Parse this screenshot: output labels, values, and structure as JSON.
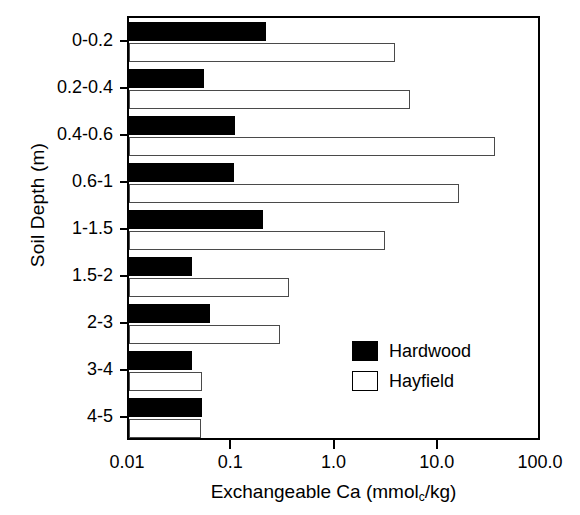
{
  "chart_data": {
    "type": "bar",
    "orientation": "horizontal",
    "title": "",
    "xlabel": "Exchangeable Ca (mmol_c/kg)",
    "xlabel_parts": {
      "main": "Exchangeable Ca (mmol",
      "sub": "c",
      "tail": "/kg)"
    },
    "ylabel": "Soil Depth (m)",
    "xscale": "log",
    "xlim": [
      0.01,
      100.0
    ],
    "xticks": [
      0.01,
      0.1,
      1.0,
      10.0,
      100.0
    ],
    "xticklabels": [
      "0.01",
      "0.1",
      "1.0",
      "10.0",
      "100.0"
    ],
    "grid": false,
    "legend_position": "center-right-inside",
    "categories": [
      "0-0.2",
      "0.2-0.4",
      "0.4-0.6",
      "0.6-1",
      "1-1.5",
      "1.5-2",
      "2-3",
      "3-4",
      "4-5"
    ],
    "series": [
      {
        "name": "Hardwood",
        "color": "#000000",
        "fill": "solid",
        "values": [
          0.21,
          0.053,
          0.107,
          0.105,
          0.2,
          0.041,
          0.061,
          0.041,
          0.051
        ]
      },
      {
        "name": "Hayfield",
        "color": "#ffffff",
        "fill": "open",
        "values": [
          3.8,
          5.3,
          35.0,
          15.7,
          3.0,
          0.355,
          0.29,
          0.051,
          0.05
        ]
      }
    ]
  },
  "legend": {
    "items": [
      {
        "label": "Hardwood",
        "swatch": "filled"
      },
      {
        "label": "Hayfield",
        "swatch": "open"
      }
    ]
  }
}
